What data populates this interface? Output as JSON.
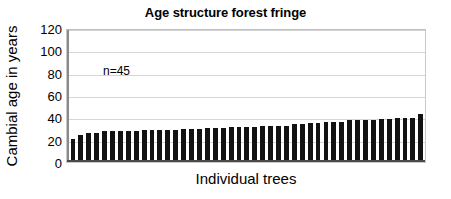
{
  "chart_data": {
    "type": "bar",
    "title": "Age structure forest fringe",
    "xlabel": "Individual trees",
    "ylabel": "Cambial age in years",
    "ylim": [
      0,
      120
    ],
    "ytick_labels": [
      "120",
      "100",
      "80",
      "60",
      "40",
      "20",
      "0"
    ],
    "ytick_values": [
      120,
      100,
      80,
      60,
      40,
      20,
      0
    ],
    "grid": true,
    "legend": "none",
    "annotations": [
      {
        "text": "n=45",
        "x_frac": 0.1,
        "y_value": 90
      }
    ],
    "bar_color": "#121212",
    "categories": [
      "1",
      "2",
      "3",
      "4",
      "5",
      "6",
      "7",
      "8",
      "9",
      "10",
      "11",
      "12",
      "13",
      "14",
      "15",
      "16",
      "17",
      "18",
      "19",
      "20",
      "21",
      "22",
      "23",
      "24",
      "25",
      "26",
      "27",
      "28",
      "29",
      "30",
      "31",
      "32",
      "33",
      "34",
      "35",
      "36",
      "37",
      "38",
      "39",
      "40",
      "41",
      "42",
      "43",
      "44",
      "45"
    ],
    "values": [
      19,
      23,
      25,
      25,
      26,
      26,
      26,
      26,
      26,
      27,
      27,
      27,
      27,
      27,
      28,
      28,
      28,
      29,
      29,
      29,
      30,
      30,
      30,
      30,
      31,
      31,
      31,
      31,
      33,
      33,
      34,
      34,
      35,
      35,
      35,
      36,
      36,
      36,
      36,
      37,
      37,
      38,
      38,
      38,
      42
    ],
    "n": 45
  }
}
